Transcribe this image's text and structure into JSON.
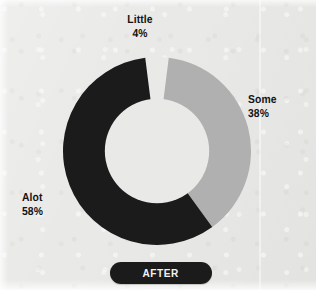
{
  "figure": {
    "caption": "AFTER",
    "background_color": "#e9e9e7"
  },
  "chart_data": {
    "type": "pie",
    "variant": "donut",
    "title": "AFTER",
    "categories": [
      "Little",
      "Some",
      "Alot"
    ],
    "values": [
      4,
      38,
      58
    ],
    "value_unit": "%",
    "labels": [
      {
        "name": "Little",
        "value": 4,
        "value_text": "4%",
        "color": "#e9e9e7",
        "position": "top"
      },
      {
        "name": "Some",
        "value": 38,
        "value_text": "38%",
        "color": "#b0b0b0",
        "position": "right"
      },
      {
        "name": "Alot",
        "value": 58,
        "value_text": "58%",
        "color": "#1b1b1b",
        "position": "left"
      }
    ],
    "start_angle_deg": -7.2,
    "inner_radius_ratio": 0.555,
    "legend": "none",
    "grid": false,
    "colors": {
      "alot": "#1b1b1b",
      "some": "#b0b0b0",
      "little": "#e9e9e7",
      "text": "#141414",
      "caption_text": "#f2f2f0",
      "caption_background": "#1b1b1b"
    }
  }
}
